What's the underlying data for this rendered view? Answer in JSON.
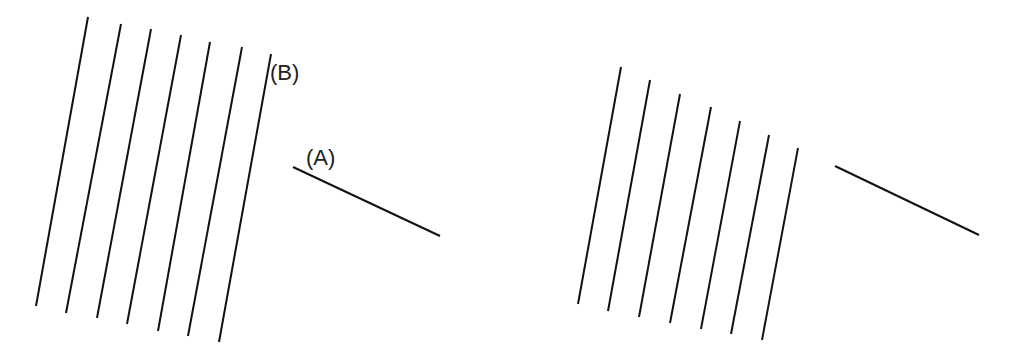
{
  "figure": {
    "stroke_color": "#111111",
    "background": "#ffffff"
  },
  "left_panel": {
    "labels": {
      "b": "(B)",
      "a": "(A)"
    },
    "parallel_lines": [
      {
        "x1": 88,
        "y1": 17,
        "x2": 36,
        "y2": 306
      },
      {
        "x1": 121,
        "y1": 24,
        "x2": 66,
        "y2": 313
      },
      {
        "x1": 151,
        "y1": 29,
        "x2": 97,
        "y2": 318
      },
      {
        "x1": 181,
        "y1": 35,
        "x2": 127,
        "y2": 324
      },
      {
        "x1": 210,
        "y1": 42,
        "x2": 158,
        "y2": 331
      },
      {
        "x1": 242,
        "y1": 47,
        "x2": 188,
        "y2": 336
      },
      {
        "x1": 271,
        "y1": 54,
        "x2": 219,
        "y2": 342
      }
    ],
    "segment_a": {
      "x1": 293,
      "y1": 167,
      "x2": 440,
      "y2": 236
    }
  },
  "right_panel": {
    "parallel_lines": [
      {
        "x1": 621,
        "y1": 67,
        "x2": 578,
        "y2": 304
      },
      {
        "x1": 650,
        "y1": 80,
        "x2": 608,
        "y2": 311
      },
      {
        "x1": 680,
        "y1": 94,
        "x2": 639,
        "y2": 317
      },
      {
        "x1": 711,
        "y1": 107,
        "x2": 670,
        "y2": 323
      },
      {
        "x1": 740,
        "y1": 121,
        "x2": 701,
        "y2": 329
      },
      {
        "x1": 769,
        "y1": 135,
        "x2": 731,
        "y2": 334
      },
      {
        "x1": 798,
        "y1": 148,
        "x2": 762,
        "y2": 340
      }
    ],
    "segment_a": {
      "x1": 835,
      "y1": 166,
      "x2": 979,
      "y2": 235
    }
  }
}
